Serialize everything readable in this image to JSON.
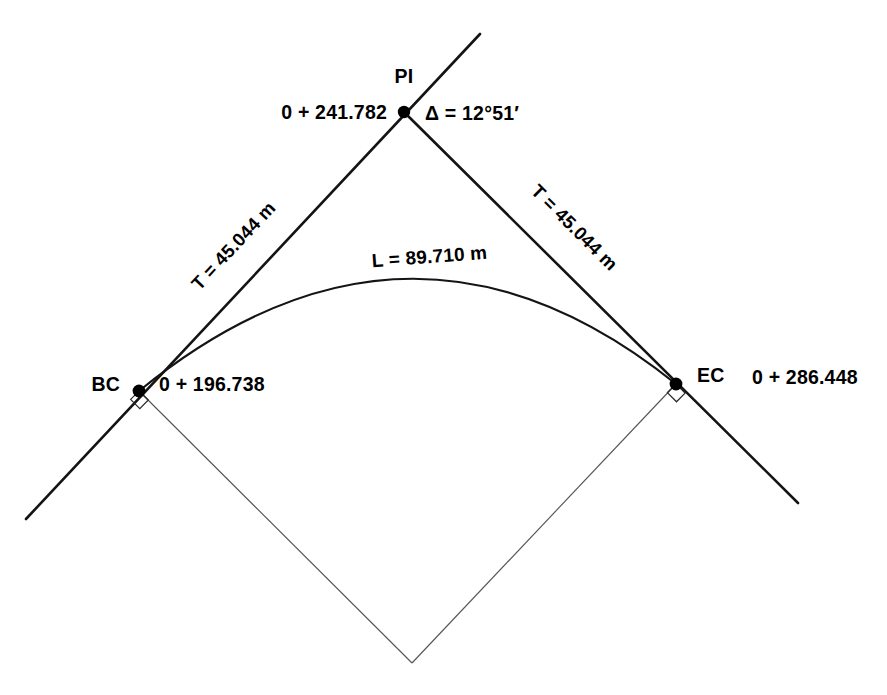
{
  "diagram": {
    "points": {
      "pi": {
        "name": "PI",
        "label": "PI",
        "station": "0 + 241.782",
        "x": 404,
        "y": 112
      },
      "bc": {
        "name": "BC",
        "label": "BC",
        "station": "0 + 196.738",
        "x": 139,
        "y": 391
      },
      "ec": {
        "name": "EC",
        "label": "EC",
        "station": "0 + 286.448",
        "x": 676,
        "y": 384
      },
      "center": {
        "name": "center-of-curve",
        "x": 412,
        "y": 663
      }
    },
    "labels": {
      "delta": "Δ = 12°51′",
      "tangent_back": "T = 45.044 m",
      "tangent_ahead": "T = 45.044 m",
      "curve_length": "L = 89.710 m"
    },
    "values": {
      "delta_degrees": 12,
      "delta_minutes": 51,
      "tangent_m": 45.044,
      "length_m": 89.71,
      "bc_station_m": 196.738,
      "pi_station_m": 241.782,
      "ec_station_m": 286.448
    },
    "geometry": {
      "back_tangent": {
        "x1": 26,
        "y1": 519,
        "x2": 480,
        "y2": 34
      },
      "ahead_tangent": {
        "x1": 404,
        "y1": 112,
        "x2": 798,
        "y2": 503
      },
      "arc_path": "M 139 391 Q 410 170 676 384",
      "radius_back": "M 139 391 L 412 663",
      "radius_ahead": "M 676 384 L 412 663"
    },
    "colors": {
      "ink": "#141414",
      "radius": "#555555",
      "background": "#ffffff"
    }
  }
}
